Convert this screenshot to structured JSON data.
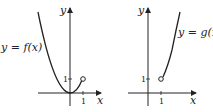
{
  "figure": {
    "left_graph": {
      "function_label": "y = f(x)",
      "x_axis_label": "x",
      "y_axis_label": "y",
      "x_tick": "1",
      "y_tick": "1",
      "curve": "parabola through origin, ends at open circle (1,1)",
      "endpoint": "open circle at (1, 1)"
    },
    "right_graph": {
      "function_label": "y = g(x",
      "x_axis_label": "x",
      "y_axis_label": "y",
      "x_tick": "1",
      "y_tick": "1",
      "curve": "increasing curve starting at open circle (1,1)",
      "endpoint": "open circle at (1, 1)"
    },
    "colors": {
      "stroke": "#222222",
      "background": "#ffffff"
    }
  }
}
